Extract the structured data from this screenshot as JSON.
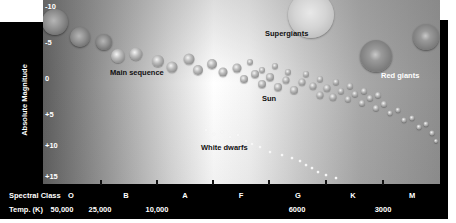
{
  "diagram": {
    "type": "hertzsprung-russell",
    "y_axis": {
      "title": "Absolute Magnitude",
      "ticks": [
        {
          "label": "-10",
          "y": 6
        },
        {
          "label": "-5",
          "y": 42
        },
        {
          "label": "0",
          "y": 78
        },
        {
          "label": "+5",
          "y": 114
        },
        {
          "label": "+10",
          "y": 145
        },
        {
          "label": "+15",
          "y": 176
        }
      ]
    },
    "x_axis": {
      "spectral_class_title": "Spectral Class",
      "spectral_classes": [
        {
          "label": "O",
          "x": 71
        },
        {
          "label": "B",
          "x": 126
        },
        {
          "label": "A",
          "x": 185
        },
        {
          "label": "F",
          "x": 241
        },
        {
          "label": "G",
          "x": 298
        },
        {
          "label": "K",
          "x": 353
        },
        {
          "label": "M",
          "x": 412
        }
      ],
      "temperature_title": "Temp. (K)",
      "temperatures": [
        {
          "label": "50,000",
          "x": 62
        },
        {
          "label": "25,000",
          "x": 100
        },
        {
          "label": "10,000",
          "x": 157
        },
        {
          "label": "6000",
          "x": 297
        },
        {
          "label": "3000",
          "x": 383
        }
      ],
      "tickmarks_x": [
        100,
        156,
        212,
        268,
        325,
        382
      ]
    },
    "regions": [
      {
        "label": "Main sequence",
        "x": 110,
        "y": 73,
        "light": false
      },
      {
        "label": "Supergiants",
        "x": 265,
        "y": 34,
        "light": false
      },
      {
        "label": "Red giants",
        "x": 381,
        "y": 76,
        "light": true
      },
      {
        "label": "Sun",
        "x": 262,
        "y": 99,
        "light": false
      },
      {
        "label": "White dwarfs",
        "x": 201,
        "y": 148,
        "light": false
      }
    ],
    "stars": [
      {
        "kind": "big",
        "x": 55,
        "y": 22,
        "d": 26
      },
      {
        "kind": "big",
        "x": 80,
        "y": 37,
        "d": 20
      },
      {
        "kind": "big",
        "x": 104,
        "y": 42,
        "d": 16
      },
      {
        "kind": "ms",
        "x": 118,
        "y": 56,
        "d": 14
      },
      {
        "kind": "ms",
        "x": 136,
        "y": 54,
        "d": 13
      },
      {
        "kind": "ms",
        "x": 158,
        "y": 61,
        "d": 12
      },
      {
        "kind": "ms",
        "x": 172,
        "y": 67,
        "d": 11
      },
      {
        "kind": "ms",
        "x": 189,
        "y": 59,
        "d": 11
      },
      {
        "kind": "ms",
        "x": 198,
        "y": 70,
        "d": 10
      },
      {
        "kind": "ms",
        "x": 212,
        "y": 64,
        "d": 10
      },
      {
        "kind": "ms",
        "x": 223,
        "y": 72,
        "d": 9
      },
      {
        "kind": "ms",
        "x": 237,
        "y": 68,
        "d": 9
      },
      {
        "kind": "ms",
        "x": 244,
        "y": 79,
        "d": 8
      },
      {
        "kind": "ms",
        "x": 255,
        "y": 74,
        "d": 8
      },
      {
        "kind": "ms",
        "x": 262,
        "y": 84,
        "d": 8
      },
      {
        "kind": "ms",
        "x": 270,
        "y": 77,
        "d": 8
      },
      {
        "kind": "ms",
        "x": 278,
        "y": 87,
        "d": 8
      },
      {
        "kind": "ms",
        "x": 286,
        "y": 80,
        "d": 7
      },
      {
        "kind": "ms",
        "x": 294,
        "y": 90,
        "d": 8
      },
      {
        "kind": "ms",
        "x": 302,
        "y": 82,
        "d": 7
      },
      {
        "kind": "ms",
        "x": 313,
        "y": 86,
        "d": 7
      },
      {
        "kind": "ms",
        "x": 320,
        "y": 95,
        "d": 7
      },
      {
        "kind": "ms",
        "x": 327,
        "y": 88,
        "d": 7
      },
      {
        "kind": "ms",
        "x": 333,
        "y": 97,
        "d": 7
      },
      {
        "kind": "ms",
        "x": 341,
        "y": 91,
        "d": 6
      },
      {
        "kind": "ms",
        "x": 348,
        "y": 99,
        "d": 6
      },
      {
        "kind": "ms",
        "x": 355,
        "y": 94,
        "d": 6
      },
      {
        "kind": "ms",
        "x": 362,
        "y": 103,
        "d": 6
      },
      {
        "kind": "ms",
        "x": 370,
        "y": 98,
        "d": 6
      },
      {
        "kind": "ms",
        "x": 376,
        "y": 108,
        "d": 6
      },
      {
        "kind": "ms",
        "x": 384,
        "y": 104,
        "d": 6
      },
      {
        "kind": "ms",
        "x": 390,
        "y": 113,
        "d": 5
      },
      {
        "kind": "ms",
        "x": 398,
        "y": 110,
        "d": 5
      },
      {
        "kind": "ms",
        "x": 404,
        "y": 120,
        "d": 5
      },
      {
        "kind": "ms",
        "x": 412,
        "y": 118,
        "d": 5
      },
      {
        "kind": "ms",
        "x": 419,
        "y": 127,
        "d": 5
      },
      {
        "kind": "ms",
        "x": 426,
        "y": 124,
        "d": 5
      },
      {
        "kind": "ms",
        "x": 432,
        "y": 133,
        "d": 5
      },
      {
        "kind": "ms",
        "x": 436,
        "y": 141,
        "d": 4
      },
      {
        "kind": "ms",
        "x": 250,
        "y": 62,
        "d": 6
      },
      {
        "kind": "ms",
        "x": 262,
        "y": 70,
        "d": 6
      },
      {
        "kind": "ms",
        "x": 275,
        "y": 66,
        "d": 6
      },
      {
        "kind": "ms",
        "x": 288,
        "y": 72,
        "d": 6
      },
      {
        "kind": "ms",
        "x": 306,
        "y": 74,
        "d": 6
      },
      {
        "kind": "ms",
        "x": 320,
        "y": 79,
        "d": 6
      },
      {
        "kind": "ms",
        "x": 336,
        "y": 82,
        "d": 6
      },
      {
        "kind": "ms",
        "x": 350,
        "y": 86,
        "d": 6
      },
      {
        "kind": "ms",
        "x": 364,
        "y": 91,
        "d": 6
      },
      {
        "kind": "ms",
        "x": 378,
        "y": 95,
        "d": 6
      },
      {
        "kind": "super",
        "x": 311,
        "y": 15,
        "d": 46
      },
      {
        "kind": "giant",
        "x": 376,
        "y": 56,
        "d": 32
      },
      {
        "kind": "giant",
        "x": 426,
        "y": 37,
        "d": 26
      },
      {
        "kind": "wd",
        "x": 206,
        "y": 130,
        "d": 3
      },
      {
        "kind": "wd",
        "x": 214,
        "y": 134,
        "d": 3
      },
      {
        "kind": "wd",
        "x": 222,
        "y": 132,
        "d": 3
      },
      {
        "kind": "wd",
        "x": 230,
        "y": 137,
        "d": 3
      },
      {
        "kind": "wd",
        "x": 238,
        "y": 135,
        "d": 3
      },
      {
        "kind": "wd",
        "x": 246,
        "y": 141,
        "d": 3
      },
      {
        "kind": "wd",
        "x": 252,
        "y": 144,
        "d": 3
      },
      {
        "kind": "wd",
        "x": 260,
        "y": 147,
        "d": 3
      },
      {
        "kind": "wd",
        "x": 270,
        "y": 152,
        "d": 3
      },
      {
        "kind": "wd",
        "x": 282,
        "y": 155,
        "d": 3
      },
      {
        "kind": "wd",
        "x": 292,
        "y": 158,
        "d": 3
      },
      {
        "kind": "wd",
        "x": 300,
        "y": 161,
        "d": 3
      },
      {
        "kind": "wd",
        "x": 306,
        "y": 165,
        "d": 3
      },
      {
        "kind": "wd",
        "x": 312,
        "y": 168,
        "d": 3
      },
      {
        "kind": "wd",
        "x": 318,
        "y": 172,
        "d": 3
      },
      {
        "kind": "wd",
        "x": 326,
        "y": 175,
        "d": 3
      },
      {
        "kind": "wd",
        "x": 336,
        "y": 178,
        "d": 3
      }
    ]
  }
}
